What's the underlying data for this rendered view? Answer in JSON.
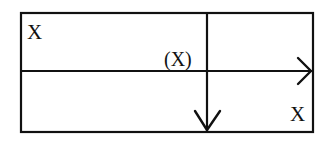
{
  "diagram": {
    "labels": {
      "top_left": "X",
      "center": "(X)",
      "bottom_right": "X"
    },
    "colors": {
      "stroke": "#111111",
      "background": "#ffffff"
    },
    "elements": [
      {
        "type": "rectangle",
        "role": "outer-frame"
      },
      {
        "type": "line",
        "role": "vertical-divider",
        "direction": "down",
        "arrowhead": true
      },
      {
        "type": "line",
        "role": "horizontal-divider",
        "direction": "right",
        "arrowhead": true
      }
    ]
  }
}
